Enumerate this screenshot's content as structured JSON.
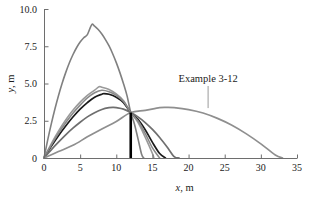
{
  "chart_data": {
    "type": "line",
    "title": "",
    "xlabel": "x, m",
    "ylabel": "y, m",
    "xlim": [
      0,
      35
    ],
    "ylim": [
      0,
      10
    ],
    "grid": false,
    "legend": null,
    "x_ticks": [
      "0",
      "5",
      "10",
      "15",
      "20",
      "25",
      "30",
      "35"
    ],
    "x_tick_values": [
      0,
      5,
      10,
      15,
      20,
      25,
      30,
      35
    ],
    "y_ticks": [
      "0",
      "2.5",
      "5.0",
      "7.5",
      "10.0"
    ],
    "y_tick_values": [
      0,
      2.5,
      5.0,
      7.5,
      10.0
    ],
    "common_point": {
      "x": 12,
      "y": 3.05,
      "label": "target point"
    },
    "annotations": [
      {
        "text": "Example 3-12",
        "x": 22.7,
        "y": 5.1,
        "leader_to_x": 22.7,
        "leader_to_y": 3.35
      }
    ],
    "series": [
      {
        "name": "trajectory-1-steep",
        "color": "#808080",
        "width": 1.6,
        "peak": {
          "x": 6.6,
          "y": 8.95
        },
        "range": 15.5,
        "points": [
          [
            0,
            0
          ],
          [
            0.5,
            1.18
          ],
          [
            1,
            2.27
          ],
          [
            1.5,
            3.27
          ],
          [
            2,
            4.18
          ],
          [
            2.5,
            5.0
          ],
          [
            3,
            5.73
          ],
          [
            3.5,
            6.38
          ],
          [
            4,
            6.93
          ],
          [
            4.5,
            7.4
          ],
          [
            5,
            7.78
          ],
          [
            5.5,
            8.07
          ],
          [
            6,
            8.28
          ],
          [
            6.6,
            8.95
          ],
          [
            7,
            8.85
          ],
          [
            7.5,
            8.62
          ],
          [
            8,
            8.32
          ],
          [
            8.5,
            7.95
          ],
          [
            9,
            7.52
          ],
          [
            9.5,
            7.0
          ],
          [
            10,
            6.4
          ],
          [
            10.5,
            5.73
          ],
          [
            11,
            4.98
          ],
          [
            11.5,
            4.15
          ],
          [
            12,
            3.05
          ],
          [
            12.5,
            2.3
          ],
          [
            13,
            1.3
          ],
          [
            13.5,
            0.25
          ],
          [
            13.8,
            0
          ]
        ]
      },
      {
        "name": "trajectory-2",
        "color": "#9a9a9a",
        "width": 1.6,
        "peak": {
          "x": 7.6,
          "y": 4.78
        },
        "range": 15.2,
        "points": [
          [
            0,
            0
          ],
          [
            1,
            0.95
          ],
          [
            2,
            1.8
          ],
          [
            3,
            2.55
          ],
          [
            4,
            3.2
          ],
          [
            5,
            3.75
          ],
          [
            6,
            4.2
          ],
          [
            7,
            4.55
          ],
          [
            7.6,
            4.78
          ],
          [
            8,
            4.75
          ],
          [
            9,
            4.6
          ],
          [
            10,
            4.3
          ],
          [
            11,
            3.85
          ],
          [
            12,
            3.05
          ],
          [
            13,
            2.4
          ],
          [
            14,
            1.4
          ],
          [
            15,
            0.3
          ],
          [
            15.2,
            0
          ]
        ]
      },
      {
        "name": "trajectory-3-black",
        "color": "#1a1a1a",
        "width": 1.7,
        "peak": {
          "x": 8.3,
          "y": 4.32
        },
        "range": 16.8,
        "points": [
          [
            0,
            0
          ],
          [
            1,
            0.78
          ],
          [
            2,
            1.5
          ],
          [
            3,
            2.15
          ],
          [
            4,
            2.75
          ],
          [
            5,
            3.28
          ],
          [
            6,
            3.72
          ],
          [
            7,
            4.08
          ],
          [
            8,
            4.28
          ],
          [
            8.3,
            4.32
          ],
          [
            9,
            4.28
          ],
          [
            10,
            4.08
          ],
          [
            11,
            3.72
          ],
          [
            12,
            3.05
          ],
          [
            13,
            2.6
          ],
          [
            14,
            1.9
          ],
          [
            15,
            1.05
          ],
          [
            16,
            0.3
          ],
          [
            16.8,
            0
          ]
        ]
      },
      {
        "name": "trajectory-4",
        "color": "#8a8a8a",
        "width": 1.6,
        "peak": {
          "x": 8.0,
          "y": 4.55
        },
        "range": 16.0,
        "points": [
          [
            0,
            0
          ],
          [
            1,
            0.86
          ],
          [
            2,
            1.65
          ],
          [
            3,
            2.36
          ],
          [
            4,
            3.0
          ],
          [
            5,
            3.55
          ],
          [
            6,
            4.03
          ],
          [
            7,
            4.38
          ],
          [
            8,
            4.55
          ],
          [
            9,
            4.45
          ],
          [
            10,
            4.2
          ],
          [
            11,
            3.8
          ],
          [
            12,
            3.05
          ],
          [
            13,
            2.5
          ],
          [
            14,
            1.65
          ],
          [
            15,
            0.68
          ],
          [
            16,
            0
          ]
        ]
      },
      {
        "name": "trajectory-5",
        "color": "#6f6f6f",
        "width": 1.7,
        "peak": {
          "x": 9.6,
          "y": 3.4
        },
        "range": 18.7,
        "points": [
          [
            0,
            0
          ],
          [
            1,
            0.55
          ],
          [
            2,
            1.06
          ],
          [
            3,
            1.55
          ],
          [
            4,
            2.0
          ],
          [
            5,
            2.4
          ],
          [
            6,
            2.76
          ],
          [
            7,
            3.04
          ],
          [
            8,
            3.26
          ],
          [
            9,
            3.38
          ],
          [
            9.6,
            3.4
          ],
          [
            10,
            3.38
          ],
          [
            11,
            3.28
          ],
          [
            12,
            3.05
          ],
          [
            13,
            2.76
          ],
          [
            14,
            2.38
          ],
          [
            15,
            1.92
          ],
          [
            16,
            1.38
          ],
          [
            17,
            0.76
          ],
          [
            18,
            0.1
          ],
          [
            18.7,
            0
          ]
        ]
      },
      {
        "name": "trajectory-6-flat-example",
        "color": "#8f8f8f",
        "width": 1.7,
        "peak": {
          "x": 17.0,
          "y": 3.4
        },
        "range": 33.0,
        "points": [
          [
            0,
            0
          ],
          [
            2,
            0.43
          ],
          [
            4,
            0.85
          ],
          [
            6,
            1.42
          ],
          [
            8,
            1.95
          ],
          [
            10,
            2.45
          ],
          [
            12,
            3.05
          ],
          [
            14,
            3.2
          ],
          [
            16,
            3.38
          ],
          [
            17,
            3.4
          ],
          [
            18,
            3.38
          ],
          [
            20,
            3.25
          ],
          [
            22,
            3.02
          ],
          [
            24,
            2.66
          ],
          [
            26,
            2.2
          ],
          [
            28,
            1.62
          ],
          [
            30,
            0.95
          ],
          [
            32,
            0.2
          ],
          [
            33,
            0
          ]
        ]
      }
    ]
  },
  "axis": {
    "x_label_var": "x",
    "x_label_unit": ", m",
    "y_label_var": "y",
    "y_label_unit": ", m"
  },
  "annotation": {
    "example_label": "Example 3-12"
  }
}
